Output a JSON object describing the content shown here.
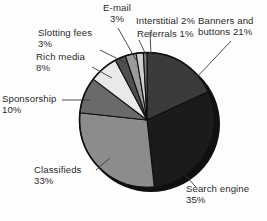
{
  "chart_data": {
    "type": "pie",
    "title": "",
    "subtitle": "",
    "xlabel": "",
    "ylabel": "",
    "legend_position": "none",
    "grid": false,
    "labels_position": "outside-with-leader-lines",
    "total_percent": 116,
    "units": "%",
    "start_angle_deg": 0,
    "direction": "clockwise",
    "categories": [
      "Banners and buttons",
      "Search engine",
      "Classifieds",
      "Sponsorship",
      "Rich media",
      "Slotting fees",
      "E-mail",
      "Interstitial",
      "Referrals"
    ],
    "values": [
      21,
      35,
      33,
      10,
      8,
      3,
      3,
      2,
      1
    ],
    "slices": [
      {
        "name": "Banners and buttons",
        "label_line1": "Banners and",
        "label_line2": "buttons 21%",
        "value": 21,
        "value_text": "21%",
        "color": "#3b3b3b"
      },
      {
        "name": "Search engine",
        "label_line1": "Search engine",
        "label_line2": "35%",
        "value": 35,
        "value_text": "35%",
        "color": "#1b1b1b"
      },
      {
        "name": "Classifieds",
        "label_line1": "Classifieds",
        "label_line2": "33%",
        "value": 33,
        "value_text": "33%",
        "color": "#8c8c8c"
      },
      {
        "name": "Sponsorship",
        "label_line1": "Sponsorship",
        "label_line2": "10%",
        "value": 10,
        "value_text": "10%",
        "color": "#6a6a6a"
      },
      {
        "name": "Rich media",
        "label_line1": "Rich media",
        "label_line2": "8%",
        "value": 8,
        "value_text": "8%",
        "color": "#e9e9e9"
      },
      {
        "name": "Slotting fees",
        "label_line1": "Slotting fees",
        "label_line2": "3%",
        "value": 3,
        "value_text": "3%",
        "color": "#4f4f4f"
      },
      {
        "name": "E-mail",
        "label_line1": "E-mail",
        "label_line2": "3%",
        "value": 3,
        "value_text": "3%",
        "color": "#9a9a9a"
      },
      {
        "name": "Interstitial",
        "label_line1": "Interstitial 2%",
        "label_line2": "",
        "value": 2,
        "value_text": "2%",
        "color": "#cfcfcf"
      },
      {
        "name": "Referrals",
        "label_line1": "Referrals 1%",
        "label_line2": "",
        "value": 1,
        "value_text": "1%",
        "color": "#7d7d7d"
      }
    ],
    "colors": {
      "background": "#fdfdfd",
      "outline": "#111111",
      "shadow": "#101010",
      "text": "#2b2b2b",
      "leader_line": "#3a3a3a"
    }
  },
  "labels": {
    "email": "E-mail\n3%",
    "interstitial": "Interstitial 2%",
    "referrals": "Referrals 1%",
    "banners": "Banners and\nbuttons 21%",
    "slotting": "Slotting fees\n3%",
    "rich_media": "Rich media\n8%",
    "sponsorship": "Sponsorship\n10%",
    "classifieds": "Classifieds\n33%",
    "search_engine": "Search engine\n35%"
  }
}
